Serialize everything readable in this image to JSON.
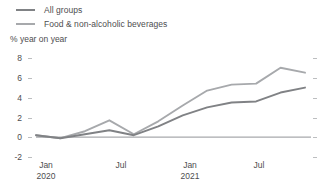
{
  "legend": {
    "position": "top-left",
    "items": [
      {
        "label": "All groups",
        "color": "#808285"
      },
      {
        "label": "Food & non-alcoholic beverages",
        "color": "#a7a9ac"
      }
    ]
  },
  "axis": {
    "y_title": "% year on year",
    "y_ticks": [
      "8",
      "6",
      "4",
      "2",
      "0",
      "-2"
    ],
    "x_ticks": [
      {
        "line1": "Jan",
        "line2": "2020"
      },
      {
        "line1": "Jul",
        "line2": ""
      },
      {
        "line1": "Jan",
        "line2": "2021"
      },
      {
        "line1": "Jul",
        "line2": ""
      }
    ]
  },
  "chart_data": {
    "type": "line",
    "title": "",
    "subtitle": "",
    "xlabel": "",
    "ylabel": "% year on year",
    "ylim": [
      -2,
      8
    ],
    "yticks": [
      -2,
      0,
      2,
      4,
      6,
      8
    ],
    "grid": false,
    "legend_position": "top-left",
    "zero_line": 0,
    "x": [
      "Oct 2019",
      "Jan 2020",
      "Apr 2020",
      "Jul 2020",
      "Oct 2020",
      "Jan 2021",
      "Apr 2021",
      "Jul 2021",
      "Oct 2021",
      "Jan 2022",
      "Apr 2022",
      "Jul 2022"
    ],
    "xtick_labels": [
      "Jan 2020",
      "Jul",
      "Jan 2021",
      "Jul"
    ],
    "series": [
      {
        "name": "All groups",
        "color": "#808285",
        "values": [
          0.2,
          -0.1,
          0.3,
          0.7,
          0.2,
          1.1,
          2.2,
          3.0,
          3.5,
          3.6,
          4.5,
          5.0
        ]
      },
      {
        "name": "Food & non-alcoholic beverages",
        "color": "#a7a9ac",
        "values": [
          0.2,
          -0.1,
          0.6,
          1.7,
          0.3,
          1.6,
          3.2,
          4.7,
          5.3,
          5.4,
          7.0,
          6.5
        ]
      }
    ]
  }
}
